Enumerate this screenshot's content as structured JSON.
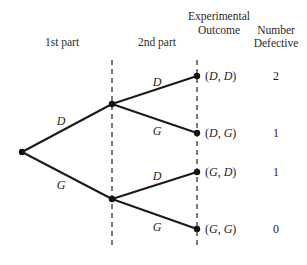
{
  "headers": {
    "stage1": "1st part",
    "stage2": "2nd part",
    "outcome_line1": "Experimental",
    "outcome_line2": "Outcome",
    "count_line1": "Number",
    "count_line2": "Defective"
  },
  "stage1_branches": [
    {
      "label": "D"
    },
    {
      "label": "G"
    }
  ],
  "stage2_branches": [
    {
      "label": "D"
    },
    {
      "label": "G"
    },
    {
      "label": "D"
    },
    {
      "label": "G"
    }
  ],
  "outcomes": [
    {
      "first": "D",
      "second": "D",
      "defective": "2"
    },
    {
      "first": "D",
      "second": "G",
      "defective": "1"
    },
    {
      "first": "G",
      "second": "D",
      "defective": "1"
    },
    {
      "first": "G",
      "second": "G",
      "defective": "0"
    }
  ],
  "colors": {
    "line": "#1a1a1a",
    "text": "#1e1e1e",
    "background": "#ffffff"
  }
}
